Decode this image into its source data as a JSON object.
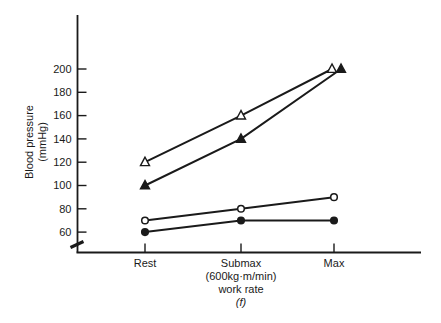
{
  "figure": {
    "background": "#ffffff",
    "ink_color": "#1a1a1a"
  },
  "chart_data": {
    "type": "line",
    "title": "",
    "categories": [
      "Rest",
      "Submax",
      "Max"
    ],
    "x_sublabel": "(600kg·m/min)",
    "xlabel": "work rate",
    "panel_label": "(f)",
    "ylabel_line1": "Blood pressure",
    "ylabel_line2": "(mmHg)",
    "y_ticks": [
      200,
      180,
      160,
      140,
      120,
      100,
      80,
      60
    ],
    "ylim": [
      50,
      215
    ],
    "axis_break": true,
    "grid": false,
    "legend": "none",
    "series": [
      {
        "name": "open-triangle",
        "marker": "triangle",
        "fill": "open",
        "values": [
          120,
          160,
          200
        ],
        "x_offsets_px": [
          0,
          0,
          -2
        ]
      },
      {
        "name": "filled-triangle",
        "marker": "triangle",
        "fill": "filled",
        "values": [
          100,
          140,
          200
        ],
        "x_offsets_px": [
          0,
          0,
          7
        ]
      },
      {
        "name": "open-circle",
        "marker": "circle",
        "fill": "open",
        "values": [
          70,
          80,
          90
        ],
        "x_offsets_px": [
          0,
          0,
          0
        ]
      },
      {
        "name": "filled-circle",
        "marker": "circle",
        "fill": "filled",
        "values": [
          60,
          70,
          70
        ],
        "x_offsets_px": [
          0,
          0,
          0
        ]
      }
    ]
  }
}
